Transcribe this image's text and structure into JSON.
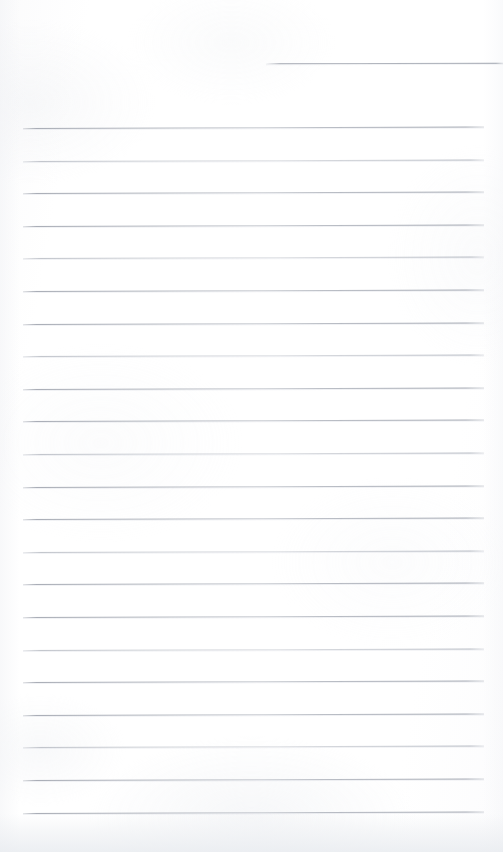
{
  "document": {
    "kind": "scanned-page",
    "title": "Lined Notebook Page",
    "description": "Blank scanned sheet of ruled notebook paper",
    "page_width": 503,
    "page_height": 852,
    "paper_color": "#ffffff",
    "rule_color": "#9aa0ab",
    "handwriting_text": "",
    "visible_text": ""
  },
  "ruling": {
    "style": "wide-ruled",
    "line_spacing_px": 32.6,
    "rule_left_x": 23,
    "rule_right_x": 484,
    "full_rule_count": 22,
    "partial_rule_count": 1,
    "first_full_rule_y": 128,
    "last_full_rule_y": 818,
    "skew_deg": -0.18
  },
  "partial_rule": {
    "label": "header-rule",
    "y": 63,
    "start_x": 266,
    "end_x": 503
  },
  "rules": [
    {
      "y": 128,
      "weight": "normal"
    },
    {
      "y": 160.6,
      "weight": "light"
    },
    {
      "y": 193.2,
      "weight": "normal"
    },
    {
      "y": 225.8,
      "weight": "normal"
    },
    {
      "y": 258.4,
      "weight": "light"
    },
    {
      "y": 291.0,
      "weight": "normal"
    },
    {
      "y": 323.6,
      "weight": "normal"
    },
    {
      "y": 356.2,
      "weight": "light"
    },
    {
      "y": 388.8,
      "weight": "normal"
    },
    {
      "y": 421.4,
      "weight": "normal"
    },
    {
      "y": 454.0,
      "weight": "light"
    },
    {
      "y": 486.6,
      "weight": "normal"
    },
    {
      "y": 519.2,
      "weight": "normal"
    },
    {
      "y": 551.8,
      "weight": "light"
    },
    {
      "y": 584.4,
      "weight": "normal"
    },
    {
      "y": 617.0,
      "weight": "normal"
    },
    {
      "y": 649.6,
      "weight": "light"
    },
    {
      "y": 682.2,
      "weight": "normal"
    },
    {
      "y": 714.8,
      "weight": "normal"
    },
    {
      "y": 747.4,
      "weight": "light"
    },
    {
      "y": 780.0,
      "weight": "normal"
    },
    {
      "y": 812.6,
      "weight": "normal"
    }
  ],
  "margins": {
    "top_blank_px": 128,
    "bottom_blank_px": 34,
    "left_px": 23,
    "right_px": 19
  },
  "artifacts": {
    "bottom_shadow_band": true,
    "edge_vignette": true,
    "scan_mottling": true
  }
}
